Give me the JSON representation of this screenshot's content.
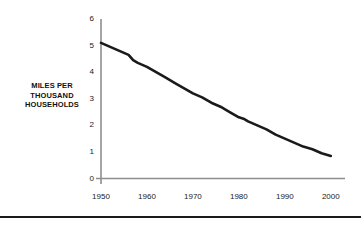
{
  "figure": {
    "y_axis_title_lines": [
      "MILES PER",
      "THOUSAND",
      "HOUSEHOLDS"
    ],
    "y_axis_title": "MILES PER THOUSAND HOUSEHOLDS",
    "colors": {
      "line": "#1a1a1a",
      "axis": "#888888",
      "text": "#1a1a1a",
      "background": "#ffffff",
      "rule": "#1a1a1a"
    }
  },
  "chart_data": {
    "type": "line",
    "title": "",
    "subtitle": "",
    "xlabel": "",
    "ylabel": "MILES PER THOUSAND HOUSEHOLDS",
    "xlim": [
      1950,
      2002
    ],
    "ylim": [
      0,
      6
    ],
    "xticks": [
      1950,
      1960,
      1970,
      1980,
      1990,
      2000
    ],
    "xtick_labels": [
      "1950",
      "1960",
      "1970",
      "1980",
      "1990",
      "2000"
    ],
    "yticks": [
      0,
      1,
      2,
      3,
      4,
      5,
      6
    ],
    "ytick_labels": [
      "0",
      "1",
      "2",
      "3",
      "4",
      "5",
      "6"
    ],
    "grid": false,
    "legend": false,
    "legend_position": "none",
    "annotations": [],
    "series": [
      {
        "name": "Miles per thousand households",
        "x": [
          1950,
          1952,
          1954,
          1956,
          1957,
          1958,
          1960,
          1962,
          1964,
          1966,
          1968,
          1970,
          1972,
          1974,
          1976,
          1978,
          1980,
          1981,
          1982,
          1984,
          1986,
          1988,
          1990,
          1992,
          1994,
          1996,
          1998,
          2000
        ],
        "values": [
          5.1,
          4.95,
          4.8,
          4.65,
          4.45,
          4.35,
          4.2,
          4.0,
          3.8,
          3.6,
          3.4,
          3.2,
          3.05,
          2.85,
          2.7,
          2.5,
          2.3,
          2.25,
          2.15,
          2.0,
          1.85,
          1.65,
          1.5,
          1.35,
          1.2,
          1.1,
          0.95,
          0.85
        ]
      }
    ]
  }
}
